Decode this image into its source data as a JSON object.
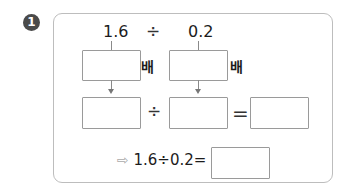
{
  "problem": {
    "number": "1",
    "dividend": "1.6",
    "divide_symbol": "÷",
    "divisor": "0.2",
    "times_label_1": "배",
    "times_label_2": "배",
    "equals_symbol": "=",
    "result_arrow": "⇨",
    "result_expression": "1.6÷0.2=",
    "inputs": {
      "dividend_multiplier": "",
      "divisor_multiplier": "",
      "new_dividend": "",
      "new_divisor": "",
      "quotient": "",
      "final_answer": ""
    }
  }
}
